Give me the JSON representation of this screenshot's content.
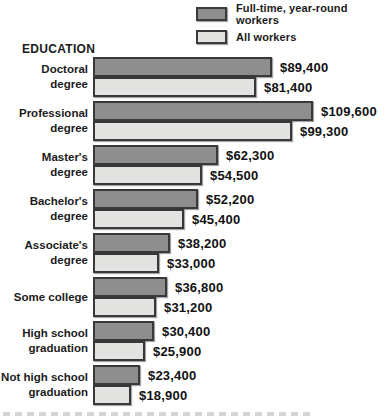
{
  "legend": {
    "items": [
      {
        "label": "Full-time, year-round workers",
        "color": "#8e8e8e"
      },
      {
        "label": "All workers",
        "color": "#e2e2e0"
      }
    ]
  },
  "chart_data": {
    "type": "bar",
    "orientation": "horizontal",
    "title": "EDUCATION",
    "xlabel": "",
    "ylabel": "EDUCATION",
    "legend_position": "top-right",
    "grid": false,
    "axis_max": 109600,
    "categories": [
      "Doctoral\ndegree",
      "Professional\ndegree",
      "Master's\ndegree",
      "Bachelor's\ndegree",
      "Associate's\ndegree",
      "Some college",
      "High school\ngraduation",
      "Not high school\ngraduation"
    ],
    "series": [
      {
        "name": "Full-time, year-round workers",
        "color": "#8e8e8e",
        "values": [
          89400,
          109600,
          62300,
          52200,
          38200,
          36800,
          30400,
          23400
        ],
        "labels": [
          "$89,400",
          "$109,600",
          "$62,300",
          "$52,200",
          "$38,200",
          "$36,800",
          "$30,400",
          "$23,400"
        ]
      },
      {
        "name": "All workers",
        "color": "#e2e2e0",
        "values": [
          81400,
          99300,
          54500,
          45400,
          33000,
          31200,
          25900,
          18900
        ],
        "labels": [
          "$81,400",
          "$99,300",
          "$54,500",
          "$45,400",
          "$33,000",
          "$31,200",
          "$25,900",
          "$18,900"
        ]
      }
    ]
  }
}
